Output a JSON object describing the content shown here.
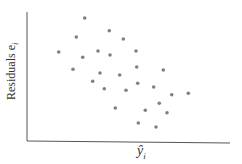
{
  "chart_data": {
    "type": "scatter",
    "title": "",
    "xlabel": "ŷ_i",
    "ylabel": "Residuals e_i",
    "grid": false,
    "legend": null,
    "ticks": false,
    "point_color": "#808080",
    "axis_color": "#555555",
    "points_px": [
      [
        84.7,
        18
      ],
      [
        109.3,
        30.7
      ],
      [
        76.3,
        37
      ],
      [
        123.3,
        39
      ],
      [
        58.7,
        52
      ],
      [
        98,
        51
      ],
      [
        110,
        55
      ],
      [
        136,
        51
      ],
      [
        82.7,
        57.3
      ],
      [
        73,
        69.3
      ],
      [
        136.7,
        67
      ],
      [
        163.3,
        70
      ],
      [
        100,
        73
      ],
      [
        119.7,
        75
      ],
      [
        92.7,
        81.3
      ],
      [
        137.7,
        83.3
      ],
      [
        153.7,
        87
      ],
      [
        104.3,
        88.7
      ],
      [
        126,
        90.3
      ],
      [
        171.7,
        94.7
      ],
      [
        188.3,
        93.3
      ],
      [
        159.3,
        103.3
      ],
      [
        115.3,
        108
      ],
      [
        145.3,
        110.3
      ],
      [
        167,
        112.7
      ],
      [
        138.3,
        123
      ],
      [
        156,
        127
      ]
    ]
  },
  "labels": {
    "y": "Residuals e",
    "y_sub": "i",
    "x": "ŷ",
    "x_sub": "i"
  }
}
